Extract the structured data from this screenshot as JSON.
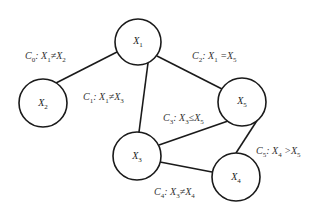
{
  "nodes": [
    {
      "id": "X1",
      "label": "X",
      "sub": "1",
      "cx": 138,
      "cy": 42,
      "r": 23
    },
    {
      "id": "X2",
      "label": "X",
      "sub": "2",
      "cx": 43,
      "cy": 103,
      "r": 24
    },
    {
      "id": "X3",
      "label": "X",
      "sub": "3",
      "cx": 137,
      "cy": 156,
      "r": 24
    },
    {
      "id": "X4",
      "label": "X",
      "sub": "4",
      "cx": 236,
      "cy": 177,
      "r": 24
    },
    {
      "id": "X5",
      "label": "X",
      "sub": "5",
      "cx": 242,
      "cy": 102,
      "r": 24
    }
  ],
  "edges": [
    {
      "from": "X1",
      "to": "X2",
      "constraint": "C0: X1 ≠ X2"
    },
    {
      "from": "X1",
      "to": "X3",
      "constraint": "C1: X1 ≠ X3"
    },
    {
      "from": "X1",
      "to": "X5",
      "constraint": "C2: X1 = X5"
    },
    {
      "from": "X3",
      "to": "X5",
      "constraint": "C3: X3 ≤ X5"
    },
    {
      "from": "X3",
      "to": "X4",
      "constraint": "C4: X3 ≠ X4"
    },
    {
      "from": "X4",
      "to": "X5",
      "constraint": "C5: X4 > X5"
    }
  ],
  "labels": {
    "c0": {
      "c": "C",
      "cs": "0",
      "a": "X",
      "as": "1",
      "op": "≠",
      "b": "X",
      "bs": "2"
    },
    "c1": {
      "c": "C",
      "cs": "1",
      "a": "X",
      "as": "1",
      "op": "≠",
      "b": "X",
      "bs": "3"
    },
    "c2": {
      "c": "C",
      "cs": "2",
      "a": "X",
      "as": "1",
      "op": "=",
      "b": "X",
      "bs": "5"
    },
    "c3": {
      "c": "C",
      "cs": "3",
      "a": "X",
      "as": "3",
      "op": "≤",
      "b": "X",
      "bs": "5"
    },
    "c4": {
      "c": "C",
      "cs": "4",
      "a": "X",
      "as": "3",
      "op": "≠",
      "b": "X",
      "bs": "4"
    },
    "c5": {
      "c": "C",
      "cs": "5",
      "a": "X",
      "as": "4",
      "op": ">",
      "b": "X",
      "bs": "5"
    }
  }
}
